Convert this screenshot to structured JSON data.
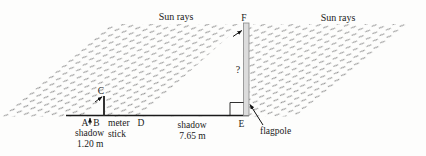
{
  "figure": {
    "title_hint": "similar-triangles shadow diagram",
    "labels": {
      "sun_rays_left": "Sun rays",
      "sun_rays_right": "Sun rays",
      "flagpole_top_point": "F",
      "flagpole_base_point": "E",
      "unknown_height": "?",
      "flagpole_name": "flagpole",
      "stick_top_point": "C",
      "stick_shadow_tip_point": "A",
      "stick_base_point": "B",
      "pole_shadow_tip_point": "D",
      "meter_stick_word1": "meter",
      "meter_stick_word2": "stick",
      "stick_shadow_word": "shadow",
      "stick_shadow_length": "1.20 m",
      "pole_shadow_word": "shadow",
      "pole_shadow_length": "7.65 m"
    },
    "colors": {
      "hatch": "#8a8a8a",
      "pole_fill": "#dcdcdc",
      "pole_stroke": "#888888",
      "ink": "#1a1a1a",
      "bg": "#fdfdfc"
    }
  }
}
